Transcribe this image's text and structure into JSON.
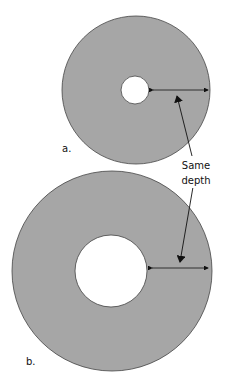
{
  "diagram": {
    "colors": {
      "disk": "#a6a6a6",
      "outline": "#444444",
      "hole": "#ffffff",
      "arrow": "#111111"
    },
    "figures": [
      {
        "label": "a.",
        "cx": 136,
        "cy": 90,
        "outer_r": 74,
        "inner_r": 14
      },
      {
        "label": "b.",
        "cx": 112,
        "cy": 271,
        "outer_r": 100,
        "inner_r": 36
      }
    ],
    "annotation": {
      "line1": "Same",
      "line2": "depth"
    }
  }
}
